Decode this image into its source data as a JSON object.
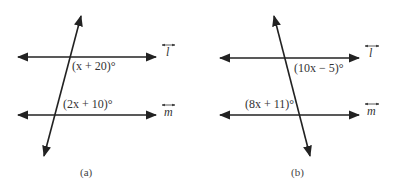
{
  "figures": [
    {
      "id": "a",
      "caption": "(a)",
      "angle_top": "(x + 20)°",
      "angle_bottom": "(2x + 10)°",
      "line_top_label": "l",
      "line_bottom_label": "m"
    },
    {
      "id": "b",
      "caption": "(b)",
      "angle_top": "(10x − 5)°",
      "angle_bottom": "(8x + 11)°",
      "line_top_label": "l",
      "line_bottom_label": "m"
    }
  ],
  "colors": {
    "stroke": "#222222",
    "text": "#333333",
    "background": "#ffffff"
  }
}
